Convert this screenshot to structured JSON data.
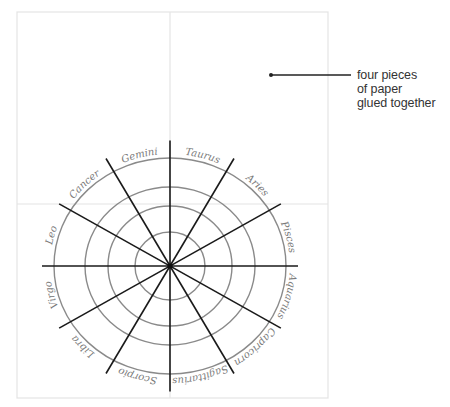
{
  "diagram": {
    "paper": {
      "x": 17,
      "y": 12,
      "width": 311,
      "height": 386,
      "split_x": 170,
      "split_y": 204,
      "border_color": "#e4e4e4"
    },
    "wheel": {
      "center": {
        "x": 170,
        "y": 266
      },
      "circles": [
        {
          "rx": 116,
          "ry": 108
        },
        {
          "rx": 85,
          "ry": 79
        },
        {
          "rx": 62,
          "ry": 60
        },
        {
          "rx": 35,
          "ry": 34
        }
      ],
      "circle_color": "#8a8a8a",
      "spoke_color": "#1a1a1a",
      "spoke_count": 12,
      "spoke_length": 128,
      "label_color": "#7a7a7a",
      "signs": [
        "Pisces",
        "Aries",
        "Taurus",
        "Gemini",
        "Cancer",
        "Leo",
        "Virgo",
        "Libra",
        "Scorpio",
        "Sagittarius",
        "Capricorn",
        "Aquarius"
      ]
    },
    "callout": {
      "dot": {
        "x": 271,
        "y": 75
      },
      "line_end_x": 351,
      "lines": [
        "four pieces",
        "of paper",
        "glued together"
      ]
    }
  }
}
